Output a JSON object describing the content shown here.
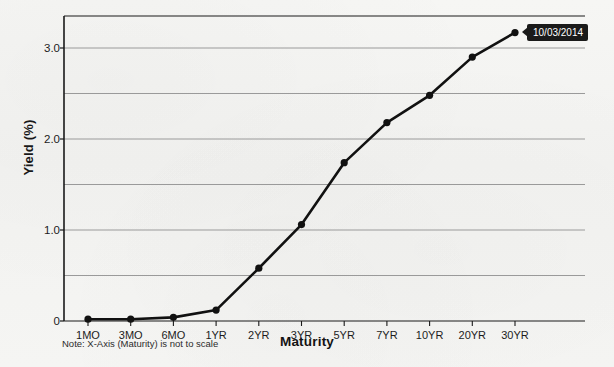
{
  "chart_data": {
    "type": "line",
    "title": "",
    "xlabel": "Maturity",
    "ylabel": "Yield (%)",
    "categories": [
      "1MO",
      "3MO",
      "6MO",
      "1YR",
      "2YR",
      "3YR",
      "5YR",
      "7YR",
      "10YR",
      "20YR",
      "30YR"
    ],
    "values": [
      0.02,
      0.02,
      0.04,
      0.12,
      0.58,
      1.06,
      1.74,
      2.18,
      2.48,
      2.9,
      3.17
    ],
    "series": [
      {
        "name": "10/03/2014",
        "values": [
          0.02,
          0.02,
          0.04,
          0.12,
          0.58,
          1.06,
          1.74,
          2.18,
          2.48,
          2.9,
          3.17
        ]
      }
    ],
    "ylim": [
      0,
      3.55
    ],
    "y_ticks": [
      0,
      1.0,
      2.0,
      3.0
    ],
    "y_tick_labels": [
      "0",
      "1.0",
      "2.0",
      "3.0"
    ],
    "y_gridlines": [
      0,
      0.5,
      1.0,
      1.5,
      2.0,
      2.5,
      3.0
    ],
    "grid": true,
    "legend_position": "none",
    "annotation": "10/03/2014",
    "note": "Note: X-Axis (Maturity) is not to scale",
    "line_color": "#111111",
    "marker_color": "#111111",
    "grid_color": "#9a9a9a",
    "axis_color": "#1a1a1a",
    "background_color": "#f4f4f2"
  }
}
